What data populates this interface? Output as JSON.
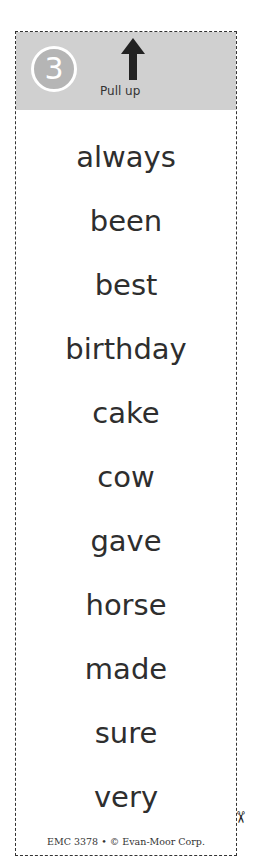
{
  "header": {
    "number": "3",
    "instruction": "Pull up",
    "icon": "up-arrow-icon"
  },
  "words": [
    "always",
    "been",
    "best",
    "birthday",
    "cake",
    "cow",
    "gave",
    "horse",
    "made",
    "sure",
    "very"
  ],
  "footer": "EMC 3378 • © Evan-Moor Corp.",
  "colors": {
    "header_bg": "#d0d0d0",
    "circle": "#b5b5b5",
    "text": "#2e2e2e"
  }
}
